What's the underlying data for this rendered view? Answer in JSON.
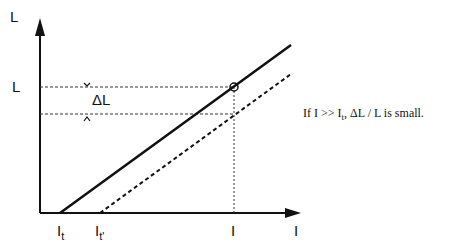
{
  "diagram": {
    "type": "line-plot-schematic",
    "y_axis": {
      "label": "L",
      "tick_label": "L"
    },
    "x_axis": {
      "label": "I",
      "tick_label": "I"
    },
    "delta_label": "ΔL",
    "threshold_labels": {
      "it": "I",
      "it_sub": "t",
      "it_prime": "I",
      "it_prime_sub": "t'"
    },
    "series": [
      {
        "name": "solid-line",
        "style": "solid",
        "x_intercept": "I_t"
      },
      {
        "name": "dashed-line",
        "style": "dashed",
        "x_intercept": "I_t'"
      }
    ],
    "marker": {
      "shape": "open-circle",
      "at": "intersection of I and L on solid line"
    },
    "annotation": {
      "pre": "If I >> I",
      "sub": "t",
      "post": ", ΔL / L is small."
    }
  }
}
